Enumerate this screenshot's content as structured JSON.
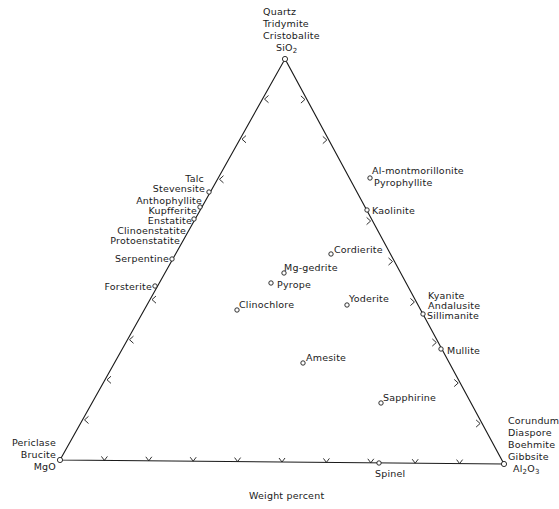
{
  "diagram": {
    "type": "ternary",
    "footer": "Weight percent",
    "vertices": {
      "top": {
        "formula_base": "SiO",
        "formula_sub": "2",
        "names": [
          "Quartz",
          "Tridymite",
          "Cristobalite"
        ],
        "x": 285,
        "y": 59
      },
      "left": {
        "formula": "MgO",
        "names": [
          "Periclase",
          "Brucite"
        ],
        "x": 60,
        "y": 460
      },
      "right": {
        "formula_a": "Al",
        "formula_sub1": "2",
        "formula_b": "O",
        "formula_sub2": "3",
        "names": [
          "Corundum",
          "Diaspore",
          "Boehmite",
          "Gibbsite"
        ],
        "x": 504,
        "y": 464
      }
    },
    "line_color": "#1a1a1a",
    "points": [
      {
        "id": "stevensite",
        "x": 209,
        "y": 192
      },
      {
        "id": "kupfferite",
        "x": 200,
        "y": 207
      },
      {
        "id": "enstatite",
        "x": 194,
        "y": 219
      },
      {
        "id": "serpentine",
        "x": 172,
        "y": 259
      },
      {
        "id": "forsterite",
        "x": 155,
        "y": 286
      },
      {
        "id": "pyrophyllite",
        "x": 370,
        "y": 178
      },
      {
        "id": "kaolinite",
        "x": 367,
        "y": 210
      },
      {
        "id": "cordierite",
        "x": 331,
        "y": 254
      },
      {
        "id": "mg-gedrite",
        "x": 284,
        "y": 273
      },
      {
        "id": "pyrope",
        "x": 271,
        "y": 283
      },
      {
        "id": "clinochlore",
        "x": 237,
        "y": 310
      },
      {
        "id": "yoderite",
        "x": 347,
        "y": 305
      },
      {
        "id": "sillimanite",
        "x": 423,
        "y": 314
      },
      {
        "id": "mullite",
        "x": 441,
        "y": 349
      },
      {
        "id": "amesite",
        "x": 303,
        "y": 363
      },
      {
        "id": "sapphirine",
        "x": 381,
        "y": 403
      },
      {
        "id": "spinel",
        "x": 379,
        "y": 463
      }
    ],
    "labels": {
      "talc": "Talc",
      "stevensite": "Stevensite",
      "anthophyllite": "Anthophyllite",
      "kupfferite": "Kupfferite",
      "enstatite": "Enstatite",
      "clinoenstatite": "Clinoenstatite",
      "protoenstatite": "Protoenstatite",
      "serpentine": "Serpentine",
      "forsterite": "Forsterite",
      "al_montmorillonite": "Al-montmorillonite",
      "pyrophyllite": "Pyrophyllite",
      "kaolinite": "Kaolinite",
      "cordierite": "Cordierite",
      "mg_gedrite": "Mg-gedrite",
      "pyrope": "Pyrope",
      "clinochlore": "Clinochlore",
      "yoderite": "Yoderite",
      "kyanite": "Kyanite",
      "andalusite": "Andalusite",
      "sillimanite": "Sillimanite",
      "mullite": "Mullite",
      "amesite": "Amesite",
      "sapphirine": "Sapphirine",
      "spinel": "Spinel"
    },
    "ticks": {
      "count_per_edge": 9,
      "left_edge_arrow": "toward-SiO2",
      "right_edge_arrow": "toward-Al2O3",
      "bottom_edge_arrow": "v"
    }
  }
}
